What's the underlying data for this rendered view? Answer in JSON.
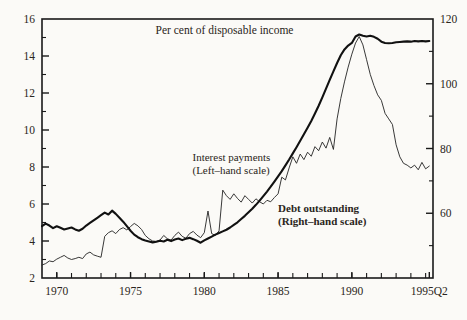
{
  "chart_data": {
    "type": "line",
    "title": "Per cent of disposable income",
    "xlabel": "",
    "ylabel": "",
    "grid": false,
    "legend_position": "inline-annotations",
    "x_axis": {
      "tick_labels": [
        "1970",
        "1975",
        "1980",
        "1985",
        "1990",
        "1995Q2"
      ],
      "tick_values": [
        1970,
        1975,
        1980,
        1985,
        1990,
        1995.25
      ],
      "minor_tick_interval": 1,
      "xlim": [
        1969.0,
        1995.5
      ]
    },
    "y_axis_left": {
      "label": "Interest payments (Left-hand scale)",
      "tick_labels": [
        "2",
        "4",
        "6",
        "8",
        "10",
        "12",
        "14",
        "16"
      ],
      "tick_values": [
        2,
        4,
        6,
        8,
        10,
        12,
        14,
        16
      ],
      "minor_tick_values": [
        3,
        5,
        7,
        9,
        11,
        13,
        15
      ],
      "ylim": [
        2,
        16
      ]
    },
    "y_axis_right": {
      "label": "Debt outstanding (Right-hand scale)",
      "tick_labels": [
        "60",
        "80",
        "100",
        "120"
      ],
      "tick_values": [
        60,
        80,
        100,
        120
      ],
      "minor_tick_values": [
        50,
        70,
        90,
        110
      ],
      "ylim": [
        40,
        120
      ]
    },
    "annotations": [
      {
        "name": "interest-payments-label",
        "lines": [
          "Interest payments",
          "(Left–hand scale)"
        ],
        "bold": false,
        "x": 1979.2,
        "y_left": 8.3
      },
      {
        "name": "debt-outstanding-label",
        "lines": [
          "Debt outstanding",
          "(Right–hand scale)"
        ],
        "bold": true,
        "x": 1985.0,
        "y_left": 5.55
      }
    ],
    "series": [
      {
        "name": "Interest payments",
        "axis": "left",
        "style": "thin",
        "color": "#232323",
        "x": [
          1969.0,
          1969.25,
          1969.5,
          1969.75,
          1970.0,
          1970.25,
          1970.5,
          1970.75,
          1971.0,
          1971.25,
          1971.5,
          1971.75,
          1972.0,
          1972.25,
          1972.5,
          1972.75,
          1973.0,
          1973.25,
          1973.5,
          1973.75,
          1974.0,
          1974.25,
          1974.5,
          1974.75,
          1975.0,
          1975.25,
          1975.5,
          1975.75,
          1976.0,
          1976.25,
          1976.5,
          1976.75,
          1977.0,
          1977.25,
          1977.5,
          1977.75,
          1978.0,
          1978.25,
          1978.5,
          1978.75,
          1979.0,
          1979.25,
          1979.5,
          1979.75,
          1980.0,
          1980.25,
          1980.5,
          1980.75,
          1981.0,
          1981.25,
          1981.5,
          1981.75,
          1982.0,
          1982.25,
          1982.5,
          1982.75,
          1983.0,
          1983.25,
          1983.5,
          1983.75,
          1984.0,
          1984.25,
          1984.5,
          1984.75,
          1985.0,
          1985.25,
          1985.5,
          1985.75,
          1986.0,
          1986.25,
          1986.5,
          1986.75,
          1987.0,
          1987.25,
          1987.5,
          1987.75,
          1988.0,
          1988.25,
          1988.5,
          1988.75,
          1989.0,
          1989.25,
          1989.5,
          1989.75,
          1990.0,
          1990.25,
          1990.5,
          1990.75,
          1991.0,
          1991.25,
          1991.5,
          1991.75,
          1992.0,
          1992.25,
          1992.5,
          1992.75,
          1993.0,
          1993.25,
          1993.5,
          1993.75,
          1994.0,
          1994.25,
          1994.5,
          1994.75,
          1995.0,
          1995.25
        ],
        "y": [
          2.7,
          2.78,
          2.92,
          2.88,
          3.02,
          3.12,
          3.22,
          3.08,
          3.0,
          3.05,
          3.12,
          3.05,
          3.3,
          3.4,
          3.25,
          3.18,
          3.12,
          4.25,
          4.45,
          4.55,
          4.4,
          4.62,
          4.72,
          4.6,
          4.78,
          4.95,
          4.82,
          4.62,
          4.3,
          4.12,
          4.0,
          3.98,
          4.05,
          4.3,
          4.12,
          4.05,
          4.3,
          4.48,
          4.25,
          4.15,
          4.4,
          4.52,
          4.32,
          4.18,
          4.45,
          5.62,
          4.4,
          4.3,
          4.55,
          6.75,
          6.45,
          6.25,
          6.55,
          6.3,
          6.1,
          6.45,
          6.25,
          6.05,
          6.28,
          6.12,
          6.0,
          6.2,
          6.12,
          6.35,
          6.55,
          7.45,
          7.3,
          7.95,
          8.55,
          8.2,
          8.7,
          8.4,
          8.8,
          8.58,
          9.1,
          8.88,
          9.35,
          9.02,
          9.6,
          8.95,
          10.6,
          11.7,
          12.6,
          13.4,
          14.1,
          14.7,
          15.05,
          14.6,
          13.8,
          13.0,
          12.4,
          11.9,
          11.6,
          10.9,
          10.6,
          10.3,
          9.2,
          8.55,
          8.2,
          8.1,
          7.95,
          8.1,
          7.85,
          8.25,
          7.9,
          8.05
        ]
      },
      {
        "name": "Debt outstanding",
        "axis": "right",
        "style": "bold",
        "color": "#111111",
        "x": [
          1969.0,
          1969.25,
          1969.5,
          1969.75,
          1970.0,
          1970.25,
          1970.5,
          1970.75,
          1971.0,
          1971.25,
          1971.5,
          1971.75,
          1972.0,
          1972.25,
          1972.5,
          1972.75,
          1973.0,
          1973.25,
          1973.5,
          1973.75,
          1974.0,
          1974.25,
          1974.5,
          1974.75,
          1975.0,
          1975.25,
          1975.5,
          1975.75,
          1976.0,
          1976.25,
          1976.5,
          1976.75,
          1977.0,
          1977.25,
          1977.5,
          1977.75,
          1978.0,
          1978.25,
          1978.5,
          1978.75,
          1979.0,
          1979.25,
          1979.5,
          1979.75,
          1980.0,
          1980.25,
          1980.5,
          1980.75,
          1981.0,
          1981.25,
          1981.5,
          1981.75,
          1982.0,
          1982.25,
          1982.5,
          1982.75,
          1983.0,
          1983.25,
          1983.5,
          1983.75,
          1984.0,
          1984.25,
          1984.5,
          1984.75,
          1985.0,
          1985.25,
          1985.5,
          1985.75,
          1986.0,
          1986.25,
          1986.5,
          1986.75,
          1987.0,
          1987.25,
          1987.5,
          1987.75,
          1988.0,
          1988.25,
          1988.5,
          1988.75,
          1989.0,
          1989.25,
          1989.5,
          1989.75,
          1990.0,
          1990.25,
          1990.5,
          1990.75,
          1991.0,
          1991.25,
          1991.5,
          1991.75,
          1992.0,
          1992.25,
          1992.5,
          1992.75,
          1993.0,
          1993.25,
          1993.5,
          1993.75,
          1994.0,
          1994.25,
          1994.5,
          1994.75,
          1995.0,
          1995.25
        ],
        "y": [
          56.0,
          56.8,
          56.2,
          55.4,
          56.0,
          55.5,
          55.0,
          55.3,
          55.6,
          55.0,
          54.6,
          55.2,
          56.2,
          57.0,
          57.8,
          58.6,
          59.4,
          60.2,
          59.6,
          60.8,
          59.8,
          58.6,
          57.4,
          56.0,
          54.6,
          53.4,
          52.6,
          52.0,
          51.6,
          51.3,
          51.0,
          51.2,
          51.5,
          51.3,
          51.8,
          51.4,
          51.9,
          52.2,
          51.7,
          52.1,
          52.4,
          52.0,
          51.5,
          50.9,
          51.6,
          52.2,
          52.8,
          53.4,
          53.9,
          54.4,
          54.9,
          55.6,
          56.4,
          57.2,
          58.2,
          59.2,
          60.3,
          61.4,
          62.6,
          63.9,
          65.3,
          66.7,
          68.2,
          69.8,
          71.4,
          73.0,
          74.8,
          76.6,
          78.5,
          80.4,
          82.4,
          84.4,
          86.4,
          88.5,
          90.8,
          93.2,
          95.8,
          98.5,
          101.2,
          103.8,
          106.4,
          108.8,
          110.6,
          111.8,
          112.6,
          114.6,
          115.2,
          114.8,
          114.6,
          114.8,
          114.5,
          113.9,
          113.0,
          112.6,
          112.5,
          112.6,
          112.8,
          112.9,
          113.0,
          113.1,
          113.0,
          113.2,
          113.1,
          113.2,
          113.1,
          113.2
        ]
      }
    ]
  }
}
